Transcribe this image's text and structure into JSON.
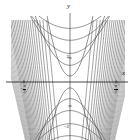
{
  "figure": {
    "axis_labels": {
      "x": "x",
      "y": "y"
    },
    "x_ticks": [
      {
        "label_minus": "−",
        "num": "π",
        "den": "2",
        "value": -1.5708
      },
      {
        "label_minus": "",
        "num": "π",
        "den": "2",
        "value": 1.5708
      }
    ],
    "y_ticks": [
      {
        "label": "2",
        "value": 2
      },
      {
        "label": "−2",
        "value": -2
      }
    ],
    "colors": {
      "axis": "#1a1a1a",
      "curve": "#4a4a4a",
      "curve_dense": "#808080",
      "background": "#ffffff"
    }
  },
  "chart_data": {
    "type": "line",
    "title": "",
    "xlabel": "x",
    "ylabel": "y",
    "xlim": [
      -3.4,
      3.4
    ],
    "ylim": [
      -5.2,
      5.2
    ],
    "grid": false,
    "legend": null,
    "xticks": [
      -1.5708,
      1.5708
    ],
    "xticklabels": [
      "-π/2",
      "π/2"
    ],
    "yticks": [
      -2,
      2
    ],
    "yticklabels": [
      "-2",
      "2"
    ],
    "series": [
      {
        "name": "c = 0.5",
        "level": 0.5,
        "vertex": [
          0,
          0.5
        ],
        "orientation": "up"
      },
      {
        "name": "c = 1.4",
        "level": 1.4,
        "vertex": [
          0,
          1.4
        ],
        "orientation": "up"
      },
      {
        "name": "c = 2.4",
        "level": 2.4,
        "vertex": [
          0,
          2.4
        ],
        "orientation": "up"
      },
      {
        "name": "c = 3.5",
        "level": 3.5,
        "vertex": [
          0,
          3.5
        ],
        "orientation": "up"
      },
      {
        "name": "c = 4.5",
        "level": 4.5,
        "vertex": [
          0,
          4.5
        ],
        "orientation": "up"
      },
      {
        "name": "c = -0.5",
        "level": -0.5,
        "vertex": [
          0,
          -0.5
        ],
        "orientation": "down"
      },
      {
        "name": "c = -1.4",
        "level": -1.4,
        "vertex": [
          0,
          -1.4
        ],
        "orientation": "down"
      },
      {
        "name": "c = -2.4",
        "level": -2.4,
        "vertex": [
          0,
          -2.4
        ],
        "orientation": "down"
      },
      {
        "name": "c = -3.5",
        "level": -3.5,
        "vertex": [
          0,
          -3.5
        ],
        "orientation": "down"
      },
      {
        "name": "c = -4.5",
        "level": -4.5,
        "vertex": [
          0,
          -4.5
        ],
        "orientation": "down"
      }
    ],
    "dense_branch_count_per_side": 26
  }
}
